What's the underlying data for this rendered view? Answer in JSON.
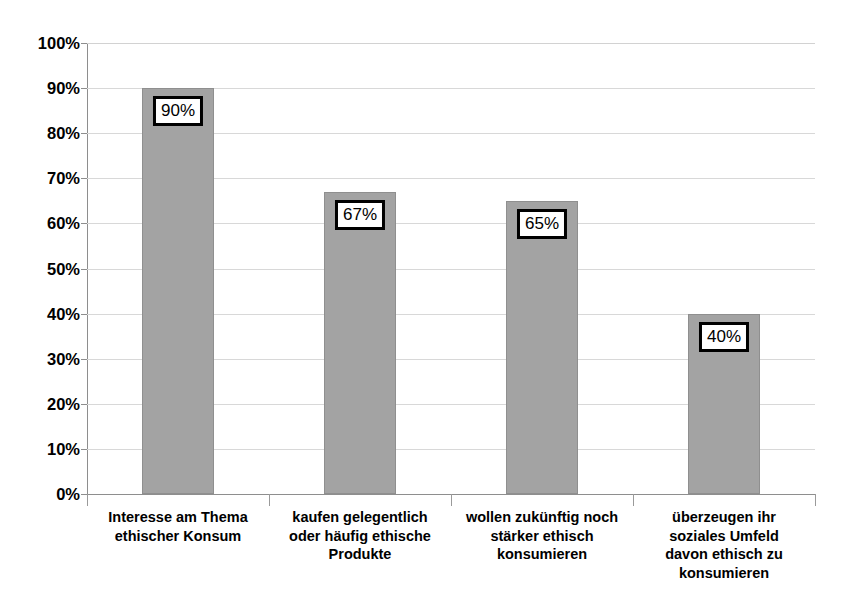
{
  "chart_data": {
    "type": "bar",
    "title": "",
    "title_note": "cut-off text fragment at top edge, illegible",
    "xlabel": "",
    "ylabel": "",
    "ylim": [
      0,
      100
    ],
    "ytick_labels": [
      "100%",
      "90%",
      "80%",
      "70%",
      "60%",
      "50%",
      "40%",
      "30%",
      "20%",
      "10%",
      "0%"
    ],
    "ytick_values": [
      100,
      90,
      80,
      70,
      60,
      50,
      40,
      30,
      20,
      10,
      0
    ],
    "grid": true,
    "legend": "none",
    "categories": [
      "Interesse am Thema ethischer Konsum",
      "kaufen gelegentlich oder häufig ethische Produkte",
      "wollen zukünftig noch stärker ethisch konsumieren",
      "überzeugen ihr soziales Umfeld davon ethisch zu konsumieren"
    ],
    "category_lines": [
      [
        "Interesse am Thema",
        "ethischer Konsum"
      ],
      [
        "kaufen gelegentlich",
        "oder häufig ethische",
        "Produkte"
      ],
      [
        "wollen zukünftig noch",
        "stärker ethisch",
        "konsumieren"
      ],
      [
        "überzeugen ihr",
        "soziales Umfeld",
        "davon ethisch zu",
        "konsumieren"
      ]
    ],
    "values": [
      90,
      67,
      65,
      40
    ],
    "data_labels": [
      "90%",
      "67%",
      "65%",
      "40%"
    ],
    "colors": {
      "bar_fill": "#a3a3a3",
      "bar_border": "#8f8f8f",
      "gridline": "#d8d8d8",
      "axis": "#8e8e8e",
      "label_border": "#000000",
      "label_background": "#ffffff",
      "text": "#000000"
    }
  }
}
